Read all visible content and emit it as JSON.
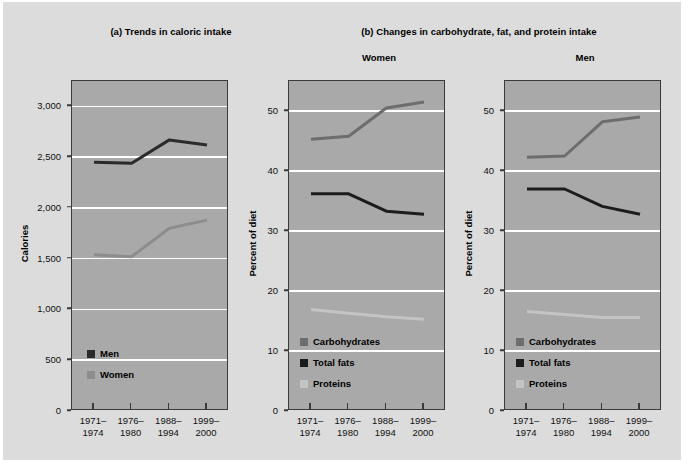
{
  "figure": {
    "background_color": "#dcdcdc",
    "plot_background_color": "#a9a9a9",
    "gridline_color": "#ffffff",
    "axis_color": "#3a3a3a"
  },
  "panel_a": {
    "title": "(a) Trends in caloric intake",
    "ylabel": "Calories",
    "yticks": [
      "0",
      "500",
      "1,000",
      "1,500",
      "2,000",
      "2,500",
      "3,000"
    ],
    "xticks": [
      {
        "line1": "1971–",
        "line2": "1974"
      },
      {
        "line1": "1976–",
        "line2": "1980"
      },
      {
        "line1": "1988–",
        "line2": "1994"
      },
      {
        "line1": "1999–",
        "line2": "2000"
      }
    ],
    "legend": [
      {
        "label": "Men",
        "color": "#2b2b2b"
      },
      {
        "label": "Women",
        "color": "#8d8d8d"
      }
    ]
  },
  "panel_b": {
    "title": "(b) Changes in carbohydrate, fat, and protein intake",
    "subpanels": [
      {
        "title": "Women"
      },
      {
        "title": "Men"
      }
    ],
    "ylabel": "Percent of diet",
    "yticks": [
      "0",
      "10",
      "20",
      "30",
      "40",
      "50"
    ],
    "xticks": [
      {
        "line1": "1971–",
        "line2": "1974"
      },
      {
        "line1": "1976–",
        "line2": "1980"
      },
      {
        "line1": "1988–",
        "line2": "1994"
      },
      {
        "line1": "1999–",
        "line2": "2000"
      }
    ],
    "legend": [
      {
        "label": "Carbohydrates",
        "color": "#6d6d6d"
      },
      {
        "label": "Total fats",
        "color": "#1c1c1c"
      },
      {
        "label": "Proteins",
        "color": "#c4c4c4"
      }
    ]
  },
  "chart_data": [
    {
      "type": "line",
      "title": "(a) Trends in caloric intake",
      "xlabel": "",
      "ylabel": "Calories",
      "categories": [
        "1971–1974",
        "1976–1980",
        "1988–1994",
        "1999–2000"
      ],
      "ylim": [
        0,
        3250
      ],
      "yticks": [
        0,
        500,
        1000,
        1500,
        2000,
        2500,
        3000
      ],
      "grid": true,
      "legend_position": "inside-lower-left",
      "series": [
        {
          "name": "Men",
          "color": "#2b2b2b",
          "values": [
            2450,
            2440,
            2670,
            2620
          ]
        },
        {
          "name": "Women",
          "color": "#8d8d8d",
          "values": [
            1540,
            1520,
            1800,
            1880
          ]
        }
      ]
    },
    {
      "type": "line",
      "title": "Women",
      "subtitle": "(b) Changes in carbohydrate, fat, and protein intake",
      "xlabel": "",
      "ylabel": "Percent of diet",
      "categories": [
        "1971–1974",
        "1976–1980",
        "1988–1994",
        "1999–2000"
      ],
      "ylim": [
        0,
        55
      ],
      "yticks": [
        0,
        10,
        20,
        30,
        40,
        50
      ],
      "grid": true,
      "legend_position": "inside-lower-left",
      "series": [
        {
          "name": "Carbohydrates",
          "color": "#6d6d6d",
          "values": [
            45.3,
            45.8,
            50.5,
            51.5
          ]
        },
        {
          "name": "Total fats",
          "color": "#1c1c1c",
          "values": [
            36.2,
            36.2,
            33.3,
            32.8
          ]
        },
        {
          "name": "Proteins",
          "color": "#c4c4c4",
          "values": [
            16.9,
            16.3,
            15.7,
            15.3
          ]
        }
      ]
    },
    {
      "type": "line",
      "title": "Men",
      "subtitle": "(b) Changes in carbohydrate, fat, and protein intake",
      "xlabel": "",
      "ylabel": "Percent of diet",
      "categories": [
        "1971–1974",
        "1976–1980",
        "1988–1994",
        "1999–2000"
      ],
      "ylim": [
        0,
        55
      ],
      "yticks": [
        0,
        10,
        20,
        30,
        40,
        50
      ],
      "grid": true,
      "legend_position": "inside-lower-left",
      "series": [
        {
          "name": "Carbohydrates",
          "color": "#6d6d6d",
          "values": [
            42.3,
            42.5,
            48.2,
            49.0
          ]
        },
        {
          "name": "Total fats",
          "color": "#1c1c1c",
          "values": [
            37.0,
            37.0,
            34.1,
            32.8
          ]
        },
        {
          "name": "Proteins",
          "color": "#c4c4c4",
          "values": [
            16.6,
            16.1,
            15.6,
            15.6
          ]
        }
      ]
    }
  ]
}
